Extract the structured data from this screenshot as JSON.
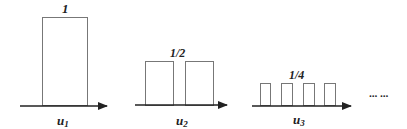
{
  "diagram": {
    "panels": [
      {
        "name": "u1",
        "height_label": "1",
        "axis_label_base": "u",
        "axis_label_sub": "1",
        "pulse_count": 1
      },
      {
        "name": "u2",
        "height_label": "1/2",
        "axis_label_base": "u",
        "axis_label_sub": "2",
        "pulse_count": 2
      },
      {
        "name": "u3",
        "height_label": "1/4",
        "axis_label_base": "u",
        "axis_label_sub": "3",
        "pulse_count": 4
      }
    ],
    "continuation": "··· ···",
    "colors": {
      "box_stroke": "#777777",
      "axis": "#222222",
      "text": "#222222"
    }
  }
}
